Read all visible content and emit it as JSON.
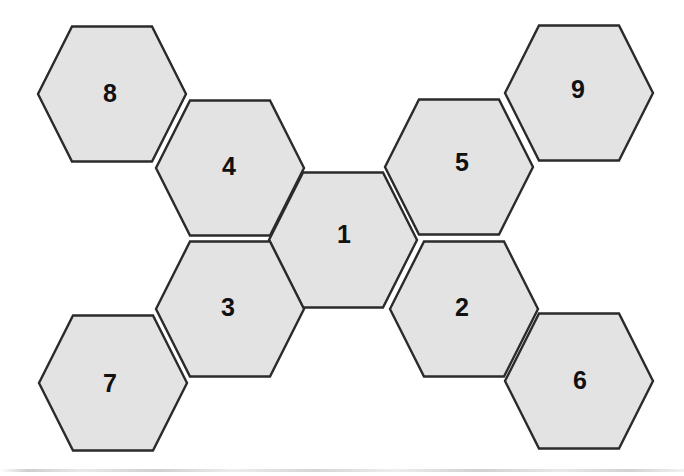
{
  "diagram": {
    "background_color": "#ffffff",
    "hex_fill_color": "#e3e3e3",
    "hex_stroke_color": "#2b2b2b",
    "hex_stroke_width": 2.4,
    "label_color": "#111111",
    "hex_half_width": 74,
    "hex_half_height": 67.5,
    "hex_top_half_width": 40,
    "tiles": [
      {
        "id": "hex-1",
        "label": "1",
        "cx": 343,
        "cy": 240,
        "label_x": 344,
        "label_y": 236
      },
      {
        "id": "hex-2",
        "label": "2",
        "cx": 464,
        "cy": 309,
        "label_x": 462,
        "label_y": 309
      },
      {
        "id": "hex-3",
        "label": "3",
        "cx": 230,
        "cy": 309,
        "label_x": 228,
        "label_y": 309
      },
      {
        "id": "hex-4",
        "label": "4",
        "cx": 230,
        "cy": 168,
        "label_x": 229,
        "label_y": 168
      },
      {
        "id": "hex-5",
        "label": "5",
        "cx": 459,
        "cy": 167,
        "label_x": 462,
        "label_y": 164
      },
      {
        "id": "hex-6",
        "label": "6",
        "cx": 579,
        "cy": 381,
        "label_x": 580,
        "label_y": 382
      },
      {
        "id": "hex-7",
        "label": "7",
        "cx": 113,
        "cy": 383,
        "label_x": 110,
        "label_y": 385
      },
      {
        "id": "hex-8",
        "label": "8",
        "cx": 112,
        "cy": 94,
        "label_x": 110,
        "label_y": 95
      },
      {
        "id": "hex-9",
        "label": "9",
        "cx": 579,
        "cy": 93,
        "label_x": 578,
        "label_y": 91
      }
    ],
    "scan_artifact": {
      "visible": true,
      "y": 469
    }
  }
}
